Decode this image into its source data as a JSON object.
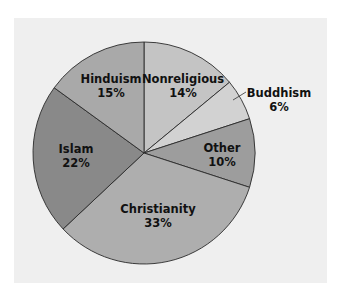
{
  "chart_data": {
    "type": "pie",
    "title": "",
    "start_angle_deg": 0,
    "direction": "clockwise",
    "slices": [
      {
        "label": "Nonreligious",
        "value": 14,
        "value_label": "14%",
        "color": "#c4c4c4"
      },
      {
        "label": "Buddhism",
        "value": 6,
        "value_label": "6%",
        "color": "#d2d2d2",
        "label_outside": true
      },
      {
        "label": "Other",
        "value": 10,
        "value_label": "10%",
        "color": "#9d9d9d"
      },
      {
        "label": "Christianity",
        "value": 33,
        "value_label": "33%",
        "color": "#aeaeae"
      },
      {
        "label": "Islam",
        "value": 22,
        "value_label": "22%",
        "color": "#898989"
      },
      {
        "label": "Hinduism",
        "value": 15,
        "value_label": "15%",
        "color": "#a9a9a9"
      }
    ],
    "categories": [
      "Nonreligious",
      "Buddhism",
      "Other",
      "Christianity",
      "Islam",
      "Hinduism"
    ],
    "values": [
      14,
      6,
      10,
      33,
      22,
      15
    ],
    "legend": "none (labels on slices)"
  },
  "labels": {
    "nonreligious": {
      "name": "Nonreligious",
      "pct": "14%"
    },
    "buddhism": {
      "name": "Buddhism",
      "pct": "6%"
    },
    "other": {
      "name": "Other",
      "pct": "10%"
    },
    "christianity": {
      "name": "Christianity",
      "pct": "33%"
    },
    "islam": {
      "name": "Islam",
      "pct": "22%"
    },
    "hinduism": {
      "name": "Hinduism",
      "pct": "15%"
    }
  },
  "colors": {
    "panel_bg": "#efefef",
    "outline": "#2a2a2a"
  }
}
